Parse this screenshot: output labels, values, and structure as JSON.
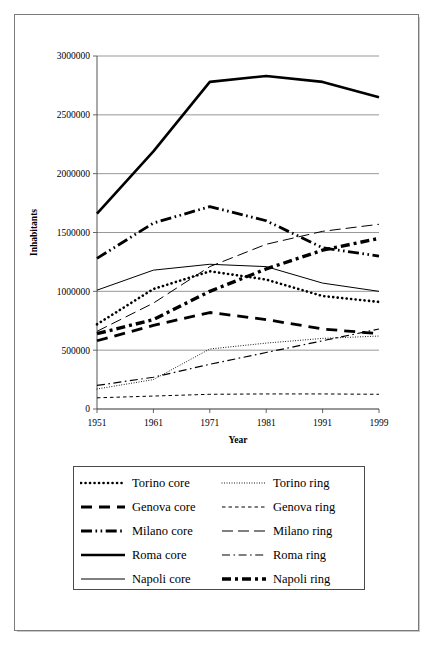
{
  "chart_data": {
    "type": "line",
    "title": "",
    "xlabel": "Year",
    "ylabel": "Inhabitants",
    "x": [
      1951,
      1961,
      1971,
      1981,
      1991,
      1999
    ],
    "xtick_labels": [
      "1951",
      "1961",
      "1971",
      "1981",
      "1991",
      "1999"
    ],
    "ytick_labels": [
      "0",
      "500000",
      "1000000",
      "1500000",
      "2000000",
      "2500000",
      "3000000"
    ],
    "yticks": [
      0,
      500000,
      1000000,
      1500000,
      2000000,
      2500000,
      3000000
    ],
    "ylim": [
      0,
      3000000
    ],
    "grid": "horizontal",
    "legend_position": "below-chart",
    "line_color": "#000000",
    "series": [
      {
        "name": "Torino core",
        "style": "thick-dotted",
        "values": [
          720000,
          1020000,
          1170000,
          1100000,
          960000,
          910000
        ]
      },
      {
        "name": "Torino ring",
        "style": "fine-dotted",
        "values": [
          170000,
          250000,
          510000,
          560000,
          600000,
          620000
        ]
      },
      {
        "name": "Genova core",
        "style": "thick-dashed",
        "values": [
          580000,
          710000,
          820000,
          760000,
          680000,
          640000
        ]
      },
      {
        "name": "Genova ring",
        "style": "short-dashed",
        "values": [
          95000,
          110000,
          125000,
          128000,
          128000,
          125000
        ]
      },
      {
        "name": "Milano core",
        "style": "thick-dash-dot-dot",
        "values": [
          1280000,
          1580000,
          1720000,
          1600000,
          1370000,
          1300000
        ]
      },
      {
        "name": "Milano ring",
        "style": "long-dashed",
        "values": [
          660000,
          900000,
          1210000,
          1400000,
          1510000,
          1570000
        ]
      },
      {
        "name": "Roma core",
        "style": "thick-solid",
        "values": [
          1660000,
          2190000,
          2780000,
          2830000,
          2780000,
          2650000
        ]
      },
      {
        "name": "Roma ring",
        "style": "dash-dot",
        "values": [
          200000,
          270000,
          380000,
          480000,
          580000,
          680000
        ]
      },
      {
        "name": "Napoli core",
        "style": "thin-solid",
        "values": [
          1010000,
          1180000,
          1230000,
          1210000,
          1070000,
          1000000
        ]
      },
      {
        "name": "Napoli ring",
        "style": "thick-block-dash",
        "values": [
          640000,
          760000,
          1000000,
          1190000,
          1350000,
          1450000
        ]
      }
    ]
  },
  "legend": {
    "entries": [
      {
        "label": "Torino core",
        "style": "thick-dotted"
      },
      {
        "label": "Torino ring",
        "style": "fine-dotted"
      },
      {
        "label": "Genova core",
        "style": "thick-dashed"
      },
      {
        "label": "Genova ring",
        "style": "short-dashed"
      },
      {
        "label": "Milano core",
        "style": "thick-dash-dot-dot"
      },
      {
        "label": "Milano ring",
        "style": "long-dashed"
      },
      {
        "label": "Roma core",
        "style": "thick-solid"
      },
      {
        "label": "Roma ring",
        "style": "dash-dot"
      },
      {
        "label": "Napoli core",
        "style": "thin-solid"
      },
      {
        "label": "Napoli ring",
        "style": "thick-block-dash"
      }
    ]
  }
}
